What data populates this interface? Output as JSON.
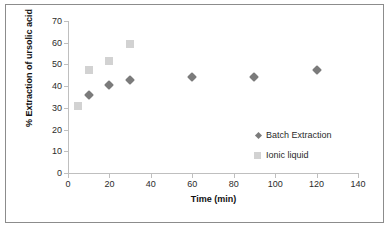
{
  "chart_data": {
    "type": "scatter",
    "title": "",
    "xlabel": "Time (min)",
    "ylabel": "% Extraction of ursolic acid",
    "xlim": [
      0,
      140
    ],
    "ylim": [
      0,
      70
    ],
    "xticks": [
      0,
      20,
      40,
      60,
      80,
      100,
      120,
      140
    ],
    "yticks": [
      0,
      10,
      20,
      30,
      40,
      50,
      60,
      70
    ],
    "grid": false,
    "legend_position": "center-right",
    "series": [
      {
        "name": "Batch Extraction",
        "marker": "diamond",
        "color": "#7b7b7b",
        "points": [
          {
            "x": 10,
            "y": 36
          },
          {
            "x": 20,
            "y": 40.5
          },
          {
            "x": 30,
            "y": 43
          },
          {
            "x": 60,
            "y": 44
          },
          {
            "x": 90,
            "y": 44
          },
          {
            "x": 120,
            "y": 47.5
          }
        ]
      },
      {
        "name": "Ionic liquid",
        "marker": "square",
        "color": "#d2d2d2",
        "points": [
          {
            "x": 5,
            "y": 31
          },
          {
            "x": 10,
            "y": 47.5
          },
          {
            "x": 20,
            "y": 51.5
          },
          {
            "x": 30,
            "y": 59.5
          }
        ]
      }
    ]
  },
  "legend": {
    "items": [
      {
        "label": "Batch Extraction"
      },
      {
        "label": "Ionic liquid"
      }
    ]
  },
  "axes": {
    "x_title": "Time (min)",
    "y_title": "% Extraction of ursolic acid"
  },
  "colors": {
    "batch_extraction": "#7b7b7b",
    "ionic_liquid": "#d2d2d2",
    "axis": "#bfbfbf",
    "frame": "#8c8c8c",
    "text": "#2b2b2b"
  }
}
